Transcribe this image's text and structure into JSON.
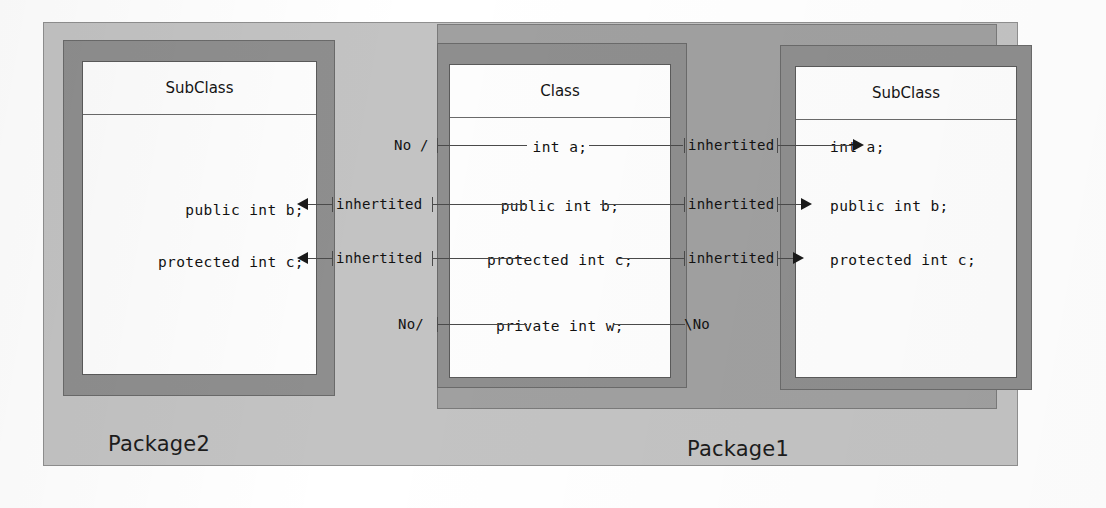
{
  "diagram": {
    "colors": {
      "package2_fill": "#c3c3c3",
      "package1_fill": "#a0a0a0",
      "class_frame": "#8e8e8e",
      "class_fill": "#fdfdfd",
      "line": "#4a4a4a",
      "text": "#111111"
    }
  },
  "packages": {
    "outer": {
      "label": "Package2"
    },
    "inner": {
      "label": "Package1"
    }
  },
  "classes": {
    "left_subclass": {
      "title": "SubClass",
      "members": [
        {
          "text": "public int b;"
        },
        {
          "text": "protected int c;"
        }
      ]
    },
    "center_class": {
      "title": "Class",
      "members": [
        {
          "text": "int a;"
        },
        {
          "text": "public int b;"
        },
        {
          "text": "protected int c;"
        },
        {
          "text": "private int w;"
        }
      ]
    },
    "right_subclass": {
      "title": "SubClass",
      "members": [
        {
          "text": "int a;"
        },
        {
          "text": "public int b;"
        },
        {
          "text": "protected int c;"
        }
      ]
    }
  },
  "connectors": {
    "left_side": [
      {
        "label": "No /",
        "row": "int a;"
      },
      {
        "label": "inhertited",
        "row": "public int b;"
      },
      {
        "label": "inhertited",
        "row": "protected int c;"
      },
      {
        "label": "No/",
        "row": "private int w;"
      }
    ],
    "right_side": [
      {
        "label": "inhertited",
        "row": "int a;"
      },
      {
        "label": "inhertited",
        "row": "public int b;"
      },
      {
        "label": "inhertited",
        "row": "protected int c;"
      },
      {
        "label": "\\No",
        "row": "private int w;"
      }
    ]
  }
}
